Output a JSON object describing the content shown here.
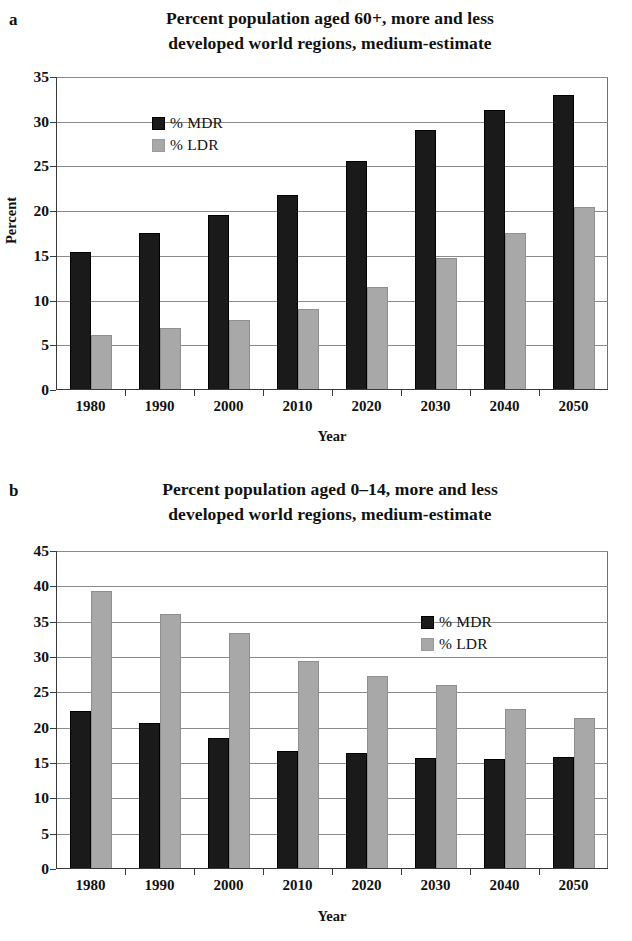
{
  "figures": [
    {
      "panel": "a",
      "title": "Percent population aged 60+, more and less developed world regions, medium-estimate",
      "title_line1": "Percent population aged 60+, more and less",
      "title_line2": "developed world regions, medium-estimate",
      "legend": [
        {
          "label": "% MDR",
          "color": "#1a1a1a"
        },
        {
          "label": "% LDR",
          "color": "#a8a8a8"
        }
      ],
      "chart_data": {
        "type": "bar",
        "title": "Percent population aged 60+, more and less developed world regions, medium-estimate",
        "xlabel": "Year",
        "ylabel": "Percent",
        "categories": [
          "1980",
          "1990",
          "2000",
          "2010",
          "2020",
          "2030",
          "2040",
          "2050"
        ],
        "series": [
          {
            "name": "% MDR",
            "color": "#1a1a1a",
            "values": [
              15.4,
              17.6,
              19.6,
              21.8,
              25.6,
              29.1,
              31.3,
              33.0
            ]
          },
          {
            "name": "% LDR",
            "color": "#a8a8a8",
            "values": [
              6.2,
              6.9,
              7.8,
              9.1,
              11.5,
              14.8,
              17.6,
              20.5
            ]
          }
        ],
        "ylim": [
          0,
          35
        ],
        "yticks": [
          0,
          5,
          10,
          15,
          20,
          25,
          30,
          35
        ],
        "ytick_labels": [
          "0",
          "5",
          "10",
          "15",
          "20",
          "25",
          "30",
          "35"
        ],
        "grid": true,
        "legend_position": "upper-left"
      }
    },
    {
      "panel": "b",
      "title": "Percent population aged 0–14, more and less developed world regions, medium-estimate",
      "title_line1": "Percent population aged 0–14, more and less",
      "title_line2": "developed world regions, medium-estimate",
      "legend": [
        {
          "label": "% MDR",
          "color": "#1a1a1a"
        },
        {
          "label": "% LDR",
          "color": "#a8a8a8"
        }
      ],
      "chart_data": {
        "type": "bar",
        "title": "Percent population aged 0–14, more and less developed world regions, medium-estimate",
        "xlabel": "Year",
        "ylabel": "Percent",
        "categories": [
          "1980",
          "1990",
          "2000",
          "2010",
          "2020",
          "2030",
          "2040",
          "2050"
        ],
        "series": [
          {
            "name": "% MDR",
            "color": "#1a1a1a",
            "values": [
              22.4,
              20.7,
              18.5,
              16.7,
              16.4,
              15.7,
              15.6,
              15.8
            ]
          },
          {
            "name": "% LDR",
            "color": "#a8a8a8",
            "values": [
              39.4,
              36.1,
              33.4,
              29.5,
              27.3,
              26.1,
              22.6,
              21.3
            ]
          }
        ],
        "ylim": [
          0,
          45
        ],
        "yticks": [
          0,
          5,
          10,
          15,
          20,
          25,
          30,
          35,
          40,
          45
        ],
        "ytick_labels": [
          "0",
          "5",
          "10",
          "15",
          "20",
          "25",
          "30",
          "35",
          "40",
          "45"
        ],
        "grid": true,
        "legend_position": "upper-right"
      }
    }
  ]
}
